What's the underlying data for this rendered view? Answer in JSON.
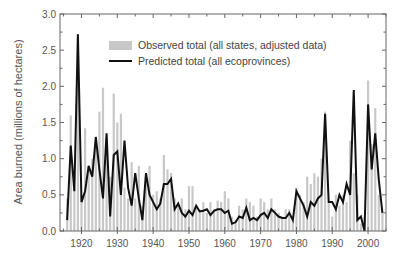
{
  "chart_data": {
    "type": "bar",
    "title": "",
    "xlabel": "",
    "ylabel": "Area burned (millions of hectares)",
    "xlim": [
      1914,
      2005
    ],
    "ylim": [
      0.0,
      3.0
    ],
    "grid": false,
    "legend_position": "upper-left-inside",
    "x_ticks": [
      "1920",
      "1930",
      "1940",
      "1950",
      "1960",
      "1970",
      "1980",
      "1990",
      "2000"
    ],
    "y_ticks": [
      "0.0",
      "0.5",
      "1.0",
      "1.5",
      "2.0",
      "2.5",
      "3.0"
    ],
    "x": [
      1916,
      1917,
      1918,
      1919,
      1920,
      1921,
      1922,
      1923,
      1924,
      1925,
      1926,
      1927,
      1928,
      1929,
      1930,
      1931,
      1932,
      1933,
      1934,
      1935,
      1936,
      1937,
      1938,
      1939,
      1940,
      1941,
      1942,
      1943,
      1944,
      1945,
      1946,
      1947,
      1948,
      1949,
      1950,
      1951,
      1952,
      1953,
      1954,
      1955,
      1956,
      1957,
      1958,
      1959,
      1960,
      1961,
      1962,
      1963,
      1964,
      1965,
      1966,
      1967,
      1968,
      1969,
      1970,
      1971,
      1972,
      1973,
      1974,
      1975,
      1976,
      1977,
      1978,
      1979,
      1980,
      1981,
      1982,
      1983,
      1984,
      1985,
      1986,
      1987,
      1988,
      1989,
      1990,
      1991,
      1992,
      1993,
      1994,
      1995,
      1996,
      1997,
      1998,
      1999,
      2000,
      2001,
      2002,
      2003,
      2004
    ],
    "series": [
      {
        "name": "Observed total (all states, adjusted data)",
        "type": "bar",
        "color": "#c8c8c8",
        "values": [
          0.45,
          1.6,
          0.6,
          2.72,
          0.5,
          1.42,
          0.85,
          1.0,
          1.25,
          1.65,
          1.98,
          1.3,
          0.75,
          1.9,
          1.5,
          1.62,
          0.6,
          0.45,
          0.95,
          0.45,
          0.9,
          0.35,
          0.75,
          0.9,
          0.5,
          0.55,
          0.45,
          1.05,
          0.85,
          0.8,
          0.45,
          0.35,
          0.45,
          0.3,
          0.62,
          0.62,
          0.35,
          0.3,
          0.4,
          0.25,
          0.4,
          0.3,
          0.42,
          0.4,
          0.55,
          0.45,
          0.2,
          0.15,
          0.35,
          0.3,
          0.45,
          0.4,
          0.35,
          0.2,
          0.45,
          0.4,
          0.3,
          0.45,
          0.3,
          0.25,
          0.2,
          0.3,
          0.3,
          0.2,
          0.6,
          0.5,
          0.4,
          0.75,
          0.65,
          0.8,
          0.75,
          1.0,
          1.65,
          0.4,
          0.2,
          0.5,
          0.35,
          0.5,
          0.4,
          1.25,
          0.8,
          0.5,
          0.1,
          0.2,
          2.08,
          1.2,
          1.7,
          0.5,
          0.25
        ]
      },
      {
        "name": "Predicted total (all ecoprovinces)",
        "type": "line",
        "color": "#111111",
        "values": [
          0.15,
          1.18,
          0.55,
          2.72,
          0.4,
          0.55,
          0.9,
          0.75,
          1.3,
          0.85,
          0.45,
          1.35,
          0.2,
          1.05,
          1.1,
          0.5,
          1.25,
          0.6,
          0.35,
          0.8,
          0.45,
          0.15,
          0.8,
          0.5,
          0.4,
          0.3,
          0.38,
          0.65,
          0.65,
          0.72,
          0.3,
          0.38,
          0.25,
          0.2,
          0.28,
          0.22,
          0.35,
          0.27,
          0.28,
          0.3,
          0.22,
          0.28,
          0.3,
          0.3,
          0.25,
          0.28,
          0.1,
          0.12,
          0.2,
          0.18,
          0.32,
          0.15,
          0.18,
          0.15,
          0.22,
          0.25,
          0.18,
          0.3,
          0.25,
          0.2,
          0.18,
          0.18,
          0.25,
          0.15,
          0.55,
          0.45,
          0.35,
          0.2,
          0.4,
          0.35,
          0.45,
          0.5,
          1.62,
          0.4,
          0.4,
          0.3,
          0.5,
          0.4,
          0.65,
          0.5,
          1.95,
          0.15,
          0.2,
          0.0,
          1.75,
          0.85,
          1.35,
          0.7,
          0.25
        ]
      }
    ]
  },
  "legend": {
    "observed_label": "Observed total (all states, adjusted data)",
    "predicted_label": "Predicted total (all ecoprovinces)"
  },
  "colors": {
    "bar": "#c8c8c8",
    "line": "#111111",
    "axis": "#555555"
  }
}
